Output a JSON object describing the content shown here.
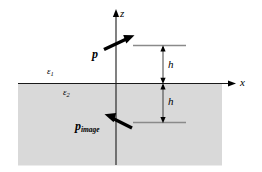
{
  "figure": {
    "type": "physics-diagram",
    "background_color": "#ffffff",
    "medium_fill_color": "#d9d9d9",
    "line_color": "#000000",
    "dimension_line_color": "#3a3a3a",
    "reference_line_color": "#808080"
  },
  "axes": {
    "z_label": "z",
    "x_label": "x",
    "origin_label": ""
  },
  "media": {
    "upper_symbol": "ε",
    "upper_subscript": "1",
    "lower_symbol": "ε",
    "lower_subscript": "2"
  },
  "dipoles": {
    "source": {
      "label": "p",
      "subscript": "",
      "direction": "up-right"
    },
    "image": {
      "label": "p",
      "subscript": "image",
      "direction": "up-left"
    }
  },
  "dimensions": [
    {
      "label": "h",
      "position": "above-interface"
    },
    {
      "label": "h",
      "position": "below-interface"
    }
  ]
}
